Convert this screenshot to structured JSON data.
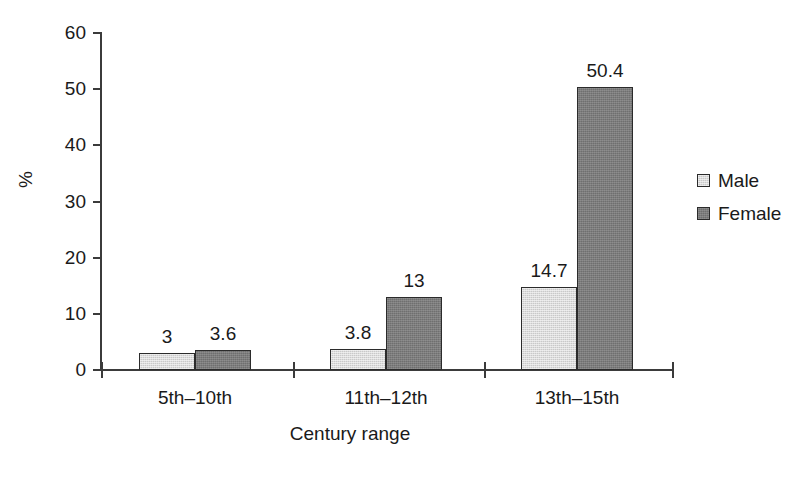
{
  "chart_data": {
    "type": "bar",
    "title": "",
    "subtitle": "",
    "xlabel": "Century range",
    "ylabel": "%",
    "categories": [
      "5th–10th",
      "11th–12th",
      "13th–15th"
    ],
    "series": [
      {
        "name": "Male",
        "color": "#c9c9c9",
        "values": [
          3,
          3.8,
          14.7
        ],
        "labels": [
          "3",
          "3.8",
          "14.7"
        ]
      },
      {
        "name": "Female",
        "color": "#6f6f6f",
        "values": [
          3.6,
          13,
          50.4
        ],
        "labels": [
          "3.6",
          "13",
          "50.4"
        ]
      }
    ],
    "ylim": [
      0,
      60
    ],
    "yticks": [
      0,
      10,
      20,
      30,
      40,
      50,
      60
    ],
    "ytick_labels": [
      "0",
      "10",
      "20",
      "30",
      "40",
      "50",
      "60"
    ],
    "grid": false,
    "legend_position": "right",
    "data_labels_shown": true,
    "axis_color": "#3b3b3b",
    "text_color": "#1a1a1a",
    "background": "#ffffff"
  },
  "legend": {
    "entries": [
      {
        "label": "Male",
        "swatch": "male-swatch"
      },
      {
        "label": "Female",
        "swatch": "female-swatch"
      }
    ]
  },
  "axes": {
    "y_title": "%",
    "x_title": "Century range"
  }
}
